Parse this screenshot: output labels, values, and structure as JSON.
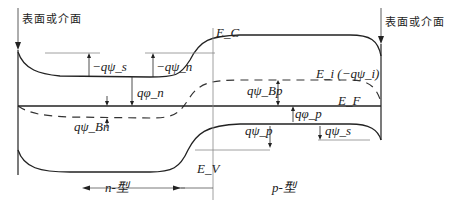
{
  "diagram": {
    "type": "energy-band-diagram",
    "surface_left_label": "表面或介面",
    "surface_right_label": "表面或介面",
    "bands": {
      "conduction": "E_C",
      "valence": "E_V",
      "intrinsic": "E_i (−qψ_i)",
      "fermi": "E_F"
    },
    "annotations": {
      "q_psi_s_left": "−qψ_s",
      "q_psi_n": "−qψ_n",
      "q_phi_n": "qφ_n",
      "q_psi_Bn": "qψ_Bn",
      "q_psi_Bp": "qψ_Bp",
      "q_phi_p": "qφ_p",
      "q_psi_p": "qψ_p",
      "q_psi_s_right": "qψ_s"
    },
    "regions": {
      "left": "n-型",
      "right": "p-型"
    }
  }
}
